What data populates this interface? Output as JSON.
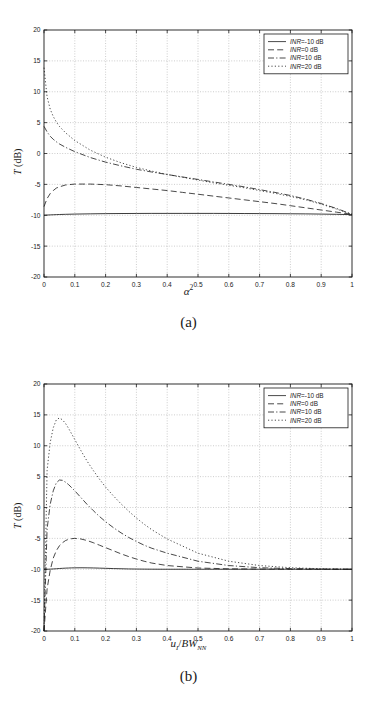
{
  "figure": {
    "panels": [
      {
        "id": "a",
        "caption": "(a)",
        "xlabel_text": "α²",
        "ylabel_text": "T (dB)"
      },
      {
        "id": "b",
        "caption": "(b)",
        "xlabel_text": "uI/BWNN",
        "ylabel_text": "T (dB)"
      }
    ],
    "legend": {
      "entries": [
        {
          "label": "INR=-10 dB",
          "prefix": "INR",
          "suffix": "=-10 dB",
          "style": "solid"
        },
        {
          "label": "INR=0 dB",
          "prefix": "INR",
          "suffix": "=0 dB",
          "style": "dashed"
        },
        {
          "label": "INR=10 dB",
          "prefix": "INR",
          "suffix": "=10 dB",
          "style": "dashdot"
        },
        {
          "label": "INR=20 dB",
          "prefix": "INR",
          "suffix": "=20 dB",
          "style": "dotted"
        }
      ]
    }
  },
  "chart_data": [
    {
      "type": "line",
      "panel": "(a)",
      "title": "",
      "xlabel": "α²",
      "ylabel": "T (dB)",
      "xlim": [
        0,
        1
      ],
      "ylim": [
        -20,
        20
      ],
      "xticks": [
        "0",
        "0.1",
        "0.2",
        "0.3",
        "0.4",
        "0.5",
        "0.6",
        "0.7",
        "0.8",
        "0.9",
        "1"
      ],
      "yticks": [
        "20",
        "15",
        "10",
        "5",
        "0",
        "-5",
        "-10",
        "-15",
        "-20"
      ],
      "grid": true,
      "legend_position": "top-right",
      "x": [
        0,
        0.01,
        0.02,
        0.03,
        0.04,
        0.05,
        0.07,
        0.1,
        0.15,
        0.2,
        0.25,
        0.3,
        0.35,
        0.4,
        0.45,
        0.5,
        0.55,
        0.6,
        0.65,
        0.7,
        0.75,
        0.8,
        0.85,
        0.9,
        0.95,
        1.0
      ],
      "series": [
        {
          "name": "INR=-10 dB",
          "style": "solid",
          "values": [
            -10.0,
            -9.97,
            -9.94,
            -9.92,
            -9.9,
            -9.88,
            -9.85,
            -9.81,
            -9.77,
            -9.74,
            -9.72,
            -9.71,
            -9.7,
            -9.7,
            -9.7,
            -9.7,
            -9.7,
            -9.71,
            -9.72,
            -9.73,
            -9.74,
            -9.76,
            -9.78,
            -9.81,
            -9.85,
            -9.9
          ]
        },
        {
          "name": "INR=0 dB",
          "style": "dashed",
          "values": [
            -8.6,
            -7.3,
            -6.5,
            -6.0,
            -5.6,
            -5.4,
            -5.1,
            -4.95,
            -4.95,
            -5.05,
            -5.25,
            -5.5,
            -5.75,
            -6.0,
            -6.3,
            -6.6,
            -6.9,
            -7.2,
            -7.5,
            -7.8,
            -8.1,
            -8.45,
            -8.8,
            -9.15,
            -9.5,
            -9.85
          ]
        },
        {
          "name": "INR=10 dB",
          "style": "dashdot",
          "values": [
            4.4,
            3.5,
            2.8,
            2.3,
            1.9,
            1.55,
            1.0,
            0.3,
            -0.65,
            -1.4,
            -2.0,
            -2.55,
            -3.0,
            -3.4,
            -3.8,
            -4.2,
            -4.6,
            -5.0,
            -5.4,
            -5.85,
            -6.3,
            -6.8,
            -7.4,
            -8.1,
            -8.9,
            -9.85
          ]
        },
        {
          "name": "INR=20 dB",
          "style": "dotted",
          "values": [
            13.9,
            9.2,
            7.2,
            6.0,
            5.1,
            4.4,
            3.35,
            2.1,
            0.55,
            -0.6,
            -1.5,
            -2.25,
            -2.85,
            -3.4,
            -3.85,
            -4.3,
            -4.75,
            -5.15,
            -5.55,
            -6.0,
            -6.45,
            -6.95,
            -7.5,
            -8.2,
            -9.0,
            -9.85
          ]
        }
      ]
    },
    {
      "type": "line",
      "panel": "(b)",
      "title": "",
      "xlabel": "uI/BWNN",
      "ylabel": "T (dB)",
      "xlim": [
        0,
        1
      ],
      "ylim": [
        -20,
        20
      ],
      "xticks": [
        "0",
        "0.1",
        "0.2",
        "0.3",
        "0.4",
        "0.5",
        "0.6",
        "0.7",
        "0.8",
        "0.9",
        "1"
      ],
      "yticks": [
        "20",
        "15",
        "10",
        "5",
        "0",
        "-5",
        "-10",
        "-15",
        "-20"
      ],
      "grid": true,
      "legend_position": "top-right",
      "x": [
        0,
        0.01,
        0.02,
        0.03,
        0.04,
        0.05,
        0.06,
        0.07,
        0.08,
        0.09,
        0.1,
        0.12,
        0.14,
        0.16,
        0.18,
        0.2,
        0.225,
        0.25,
        0.275,
        0.3,
        0.325,
        0.35,
        0.4,
        0.5,
        0.6,
        0.7,
        0.8,
        0.9,
        1.0
      ],
      "series": [
        {
          "name": "INR=-10 dB",
          "style": "solid",
          "values": [
            -10.0,
            -10.0,
            -9.98,
            -9.95,
            -9.92,
            -9.88,
            -9.85,
            -9.82,
            -9.8,
            -9.78,
            -9.77,
            -9.76,
            -9.77,
            -9.79,
            -9.82,
            -9.85,
            -9.89,
            -9.92,
            -9.95,
            -9.97,
            -9.98,
            -9.99,
            -10.0,
            -10.0,
            -10.0,
            -10.0,
            -10.0,
            -10.0,
            -10.0
          ]
        },
        {
          "name": "INR=0 dB",
          "style": "dashed",
          "values": [
            -20.0,
            -13.2,
            -10.2,
            -8.2,
            -7.0,
            -6.2,
            -5.7,
            -5.35,
            -5.15,
            -5.05,
            -5.0,
            -5.1,
            -5.35,
            -5.7,
            -6.1,
            -6.5,
            -7.0,
            -7.5,
            -7.95,
            -8.35,
            -8.7,
            -9.0,
            -9.4,
            -9.8,
            -9.93,
            -9.97,
            -9.99,
            -10.0,
            -10.0
          ]
        },
        {
          "name": "INR=10 dB",
          "style": "dashdot",
          "values": [
            -20.0,
            -3.5,
            0.5,
            2.7,
            4.0,
            4.45,
            4.4,
            4.1,
            3.7,
            3.2,
            2.7,
            1.6,
            0.5,
            -0.5,
            -1.45,
            -2.3,
            -3.25,
            -4.1,
            -4.85,
            -5.5,
            -6.1,
            -6.6,
            -7.4,
            -8.7,
            -9.4,
            -9.75,
            -9.9,
            -9.97,
            -10.0
          ]
        },
        {
          "name": "INR=20 dB",
          "style": "dotted",
          "values": [
            -20.0,
            6.0,
            10.5,
            12.9,
            14.2,
            14.5,
            14.2,
            13.6,
            12.8,
            11.9,
            11.0,
            9.2,
            7.5,
            6.0,
            4.6,
            3.3,
            1.9,
            0.6,
            -0.6,
            -1.7,
            -2.7,
            -3.6,
            -5.1,
            -7.4,
            -8.7,
            -9.4,
            -9.75,
            -9.92,
            -10.0
          ]
        }
      ]
    }
  ]
}
